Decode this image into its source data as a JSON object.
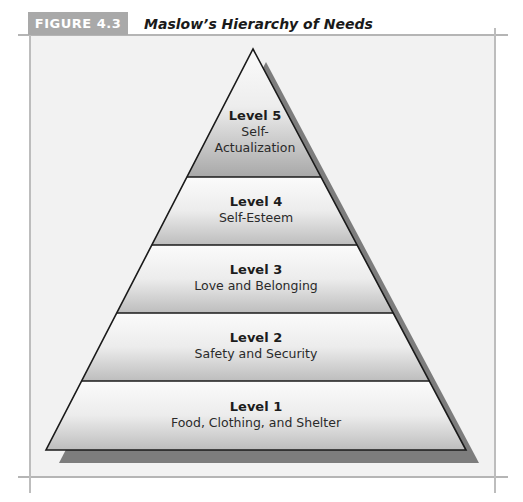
{
  "figure": {
    "label": "FIGURE 4.3",
    "title": "Maslow’s Hierarchy of Needs"
  },
  "colors": {
    "label_bg": "#a9a9a9",
    "panel_bg": "#f2f2f2",
    "shadow": "#7a7a7a",
    "outline": "#1a1a1a",
    "gradient_top": "#fafafa",
    "gradient_bottom": "#b8b8b8"
  },
  "levels": [
    {
      "level": "Level 5",
      "need_line1": "Self-",
      "need_line2": "Actualization"
    },
    {
      "level": "Level 4",
      "need_line1": "Self-Esteem"
    },
    {
      "level": "Level 3",
      "need_line1": "Love and Belonging"
    },
    {
      "level": "Level 2",
      "need_line1": "Safety and Security"
    },
    {
      "level": "Level 1",
      "need_line1": "Food, Clothing, and Shelter"
    }
  ]
}
